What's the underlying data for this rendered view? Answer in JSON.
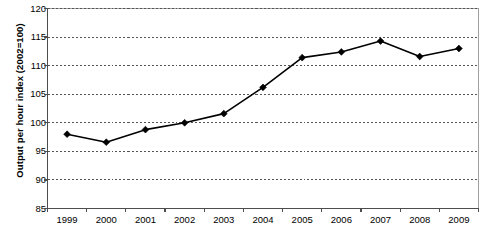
{
  "chart_data": {
    "type": "line",
    "title": "",
    "subtitle": "",
    "xlabel": "",
    "ylabel": "Output per hour index (2002=100)",
    "categories": [
      "1999",
      "2000",
      "2001",
      "2002",
      "2003",
      "2004",
      "2005",
      "2006",
      "2007",
      "2008",
      "2009"
    ],
    "series": [
      {
        "name": "Output per hour index",
        "values": [
          98.0,
          96.6,
          98.8,
          100.0,
          101.6,
          106.2,
          111.4,
          112.4,
          114.3,
          111.6,
          113.0
        ],
        "color": "#000000",
        "marker": "diamond",
        "line_width": 1.6
      }
    ],
    "ylim": [
      85,
      120
    ],
    "y_ticks": [
      85,
      90,
      95,
      100,
      105,
      110,
      115,
      120
    ],
    "y_tick_labels": [
      "85",
      "90",
      "95",
      "100",
      "105",
      "110",
      "115",
      "120"
    ],
    "x_ticks": [
      "1999",
      "2000",
      "2001",
      "2002",
      "2003",
      "2004",
      "2005",
      "2006",
      "2007",
      "2008",
      "2009"
    ],
    "grid": {
      "horizontal": true,
      "vertical": false,
      "style": "dotted",
      "color": "#555555"
    },
    "legend": {
      "visible": false,
      "position": "none"
    },
    "plot_border_color": "#a0a0a0",
    "axis_color": "#4d4d4d",
    "background_color": "#ffffff"
  },
  "figure": {
    "y_axis_title": "Output per hour index (2002=100)",
    "source_note": ""
  }
}
